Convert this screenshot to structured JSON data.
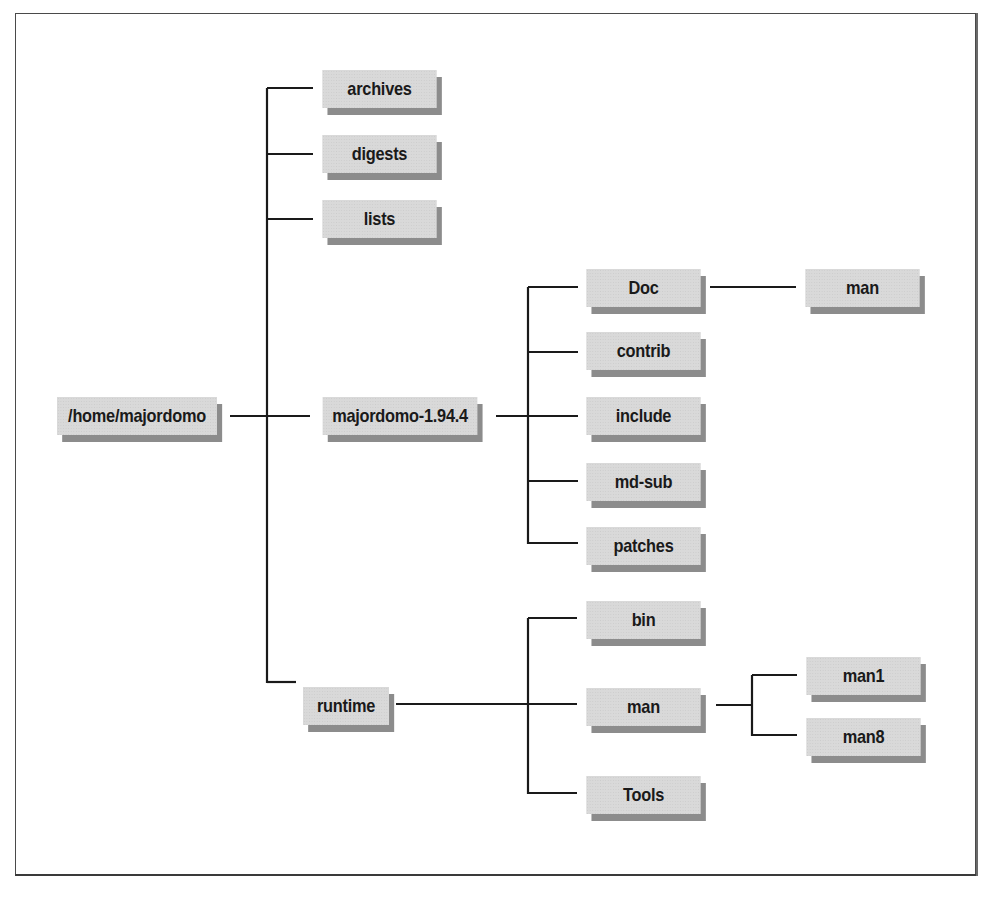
{
  "diagram": {
    "type": "directory-tree",
    "root": {
      "label": "/home/majordomo",
      "children": [
        {
          "label": "archives"
        },
        {
          "label": "digests"
        },
        {
          "label": "lists"
        },
        {
          "label": "majordomo-1.94.4",
          "children": [
            {
              "label": "Doc",
              "children": [
                {
                  "label": "man"
                }
              ]
            },
            {
              "label": "contrib"
            },
            {
              "label": "include"
            },
            {
              "label": "md-sub"
            },
            {
              "label": "patches"
            }
          ]
        },
        {
          "label": "runtime",
          "children": [
            {
              "label": "bin"
            },
            {
              "label": "man",
              "children": [
                {
                  "label": "man1"
                },
                {
                  "label": "man8"
                }
              ]
            },
            {
              "label": "Tools"
            }
          ]
        }
      ]
    }
  },
  "nodes": {
    "home": "/home/majordomo",
    "archives": "archives",
    "digests": "digests",
    "lists": "lists",
    "majordomo": "majordomo-1.94.4",
    "doc": "Doc",
    "doc_man": "man",
    "contrib": "contrib",
    "include": "include",
    "md_sub": "md-sub",
    "patches": "patches",
    "runtime": "runtime",
    "bin": "bin",
    "runtime_man": "man",
    "man1": "man1",
    "man8": "man8",
    "tools": "Tools"
  },
  "colors": {
    "box_fill": "#d9d9d9",
    "box_shadow": "#8c8c8c",
    "line": "#1a1a1a",
    "text": "#1a1a1a"
  }
}
